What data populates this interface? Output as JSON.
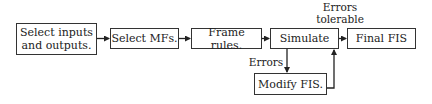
{
  "diagram": {
    "type": "flowchart",
    "nodes": [
      {
        "id": "select_io",
        "label": "Select inputs and outputs.",
        "line1": "Select inputs",
        "line2": "and outputs."
      },
      {
        "id": "select_mfs",
        "label": "Select MFs."
      },
      {
        "id": "frame_rules",
        "label": "Frame rules."
      },
      {
        "id": "simulate",
        "label": "Simulate"
      },
      {
        "id": "final_fis",
        "label": "Final FIS"
      },
      {
        "id": "modify_fis",
        "label": "Modify FIS."
      }
    ],
    "edges": [
      {
        "from": "select_io",
        "to": "select_mfs"
      },
      {
        "from": "select_mfs",
        "to": "frame_rules"
      },
      {
        "from": "frame_rules",
        "to": "simulate"
      },
      {
        "from": "simulate",
        "to": "final_fis",
        "label": "Errors tolerable"
      },
      {
        "from": "simulate",
        "to": "modify_fis",
        "label": "Errors"
      },
      {
        "from": "modify_fis",
        "to": "simulate"
      }
    ],
    "edge_labels": {
      "tolerable_line1": "Errors",
      "tolerable_line2": "tolerable",
      "errors": "Errors"
    }
  }
}
